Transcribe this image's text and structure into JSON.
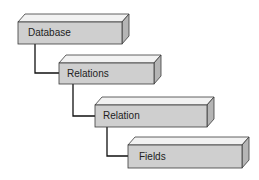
{
  "diagram": {
    "type": "hierarchy",
    "colors": {
      "front": "#cfcfcf",
      "top": "#f2f2f2",
      "side": "#b5b5b5",
      "stroke": "#3a3a3a",
      "connector": "#111111"
    },
    "boxes": [
      {
        "label": "Database",
        "x": 18,
        "y": 22,
        "w": 104,
        "h": 22
      },
      {
        "label": "Relations",
        "x": 59,
        "y": 63,
        "w": 95,
        "h": 21
      },
      {
        "label": "Relation",
        "x": 95,
        "y": 105,
        "w": 112,
        "h": 22
      },
      {
        "label": "Fields",
        "x": 128,
        "y": 145,
        "w": 114,
        "h": 23
      }
    ]
  }
}
